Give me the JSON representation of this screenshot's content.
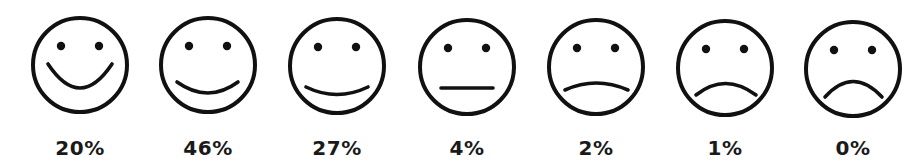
{
  "chart_data": {
    "type": "table",
    "title": "",
    "categories": [
      "very-happy",
      "happy",
      "slightly-happy",
      "neutral",
      "slightly-sad",
      "sad",
      "very-sad"
    ],
    "values": [
      20,
      46,
      27,
      4,
      2,
      1,
      0
    ],
    "labels": [
      "20%",
      "46%",
      "27%",
      "4%",
      "2%",
      "1%",
      "0%"
    ],
    "unit": "%"
  },
  "faces": [
    {
      "name": "very-happy",
      "cx": 80,
      "cy": 65,
      "label": "20%",
      "mouth": "M48 64 Q80 112 112 64"
    },
    {
      "name": "happy",
      "cx": 208,
      "cy": 65,
      "label": "46%",
      "mouth": "M177 82 Q208 104 238 82"
    },
    {
      "name": "slightly-happy",
      "cx": 337,
      "cy": 66,
      "label": "27%",
      "mouth": "M306 87 Q337 102 368 87"
    },
    {
      "name": "neutral",
      "cx": 467,
      "cy": 67,
      "label": "4%",
      "mouth": "M441 88 L493 88"
    },
    {
      "name": "slightly-sad",
      "cx": 596,
      "cy": 67,
      "label": "2%",
      "mouth": "M565 90 Q596 76 628 90"
    },
    {
      "name": "sad",
      "cx": 725,
      "cy": 68,
      "label": "1%",
      "mouth": "M696 95 Q725 72 756 95"
    },
    {
      "name": "very-sad",
      "cx": 853,
      "cy": 69,
      "label": "0%",
      "mouth": "M825 97 Q853 66 882 97"
    }
  ],
  "colors": {
    "stroke": "#111111",
    "text": "#1a1a1a",
    "background": "#ffffff"
  }
}
